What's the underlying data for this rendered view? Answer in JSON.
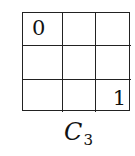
{
  "diagram": {
    "rows": 3,
    "cols": 3,
    "cells": [
      [
        "0",
        "",
        ""
      ],
      [
        "",
        "",
        ""
      ],
      [
        "",
        "",
        "1"
      ]
    ],
    "label": {
      "main": "C",
      "subscript": "3"
    }
  }
}
